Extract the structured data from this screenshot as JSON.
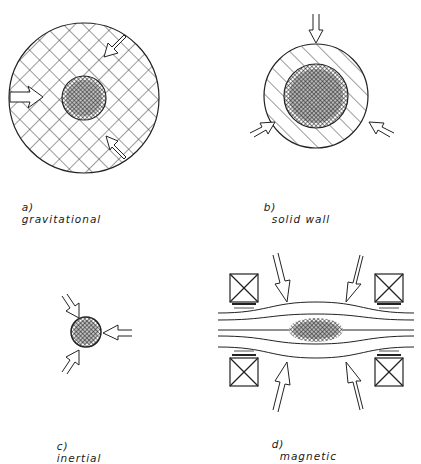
{
  "figure": {
    "panels": [
      {
        "id": "a",
        "letter": "a)",
        "caption": "gravitational"
      },
      {
        "id": "b",
        "letter": "b)",
        "caption": "solid wall"
      },
      {
        "id": "c",
        "letter": "c)",
        "caption": "inertial"
      },
      {
        "id": "d",
        "letter": "d)",
        "caption": "magnetic"
      }
    ]
  },
  "colors": {
    "ink": "#1a1a1a",
    "background": "#ffffff"
  }
}
